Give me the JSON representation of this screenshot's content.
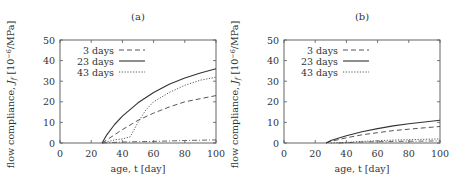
{
  "chart_data": [
    {
      "type": "line",
      "title": "(a)",
      "xlabel": "age, t [day]",
      "ylabel": "flow compliance, J_f [10^-6/MPa]",
      "xlim": [
        0,
        100
      ],
      "ylim": [
        0,
        50
      ],
      "xticks": [
        0,
        20,
        40,
        60,
        80,
        100
      ],
      "yticks": [
        0,
        10,
        20,
        30,
        40,
        50
      ],
      "grid": false,
      "legend_position": "upper left",
      "series": [
        {
          "name": "3 days",
          "style": "dashed",
          "x": [
            27,
            30,
            40,
            50,
            60,
            70,
            80,
            90,
            100
          ],
          "values": [
            0,
            1.5,
            6.5,
            11,
            14.5,
            17.5,
            20,
            21.5,
            23
          ]
        },
        {
          "name": "23 days",
          "style": "solid",
          "x": [
            27,
            30,
            35,
            40,
            50,
            60,
            70,
            80,
            90,
            100
          ],
          "values": [
            0,
            4,
            9,
            13,
            19.5,
            24.5,
            28.5,
            31.5,
            34,
            36
          ]
        },
        {
          "name": "43 days",
          "style": "dotted",
          "x": [
            27,
            35,
            40,
            45,
            50,
            55,
            60,
            70,
            80,
            90,
            100
          ],
          "values": [
            0,
            1.5,
            2,
            3,
            10,
            16,
            20,
            24.5,
            28,
            30.5,
            32
          ]
        },
        {
          "name": "",
          "style": "dash-dot",
          "x": [
            27,
            40,
            60,
            80,
            100
          ],
          "values": [
            0,
            0.5,
            0.8,
            1.2,
            1.5
          ]
        }
      ]
    },
    {
      "type": "line",
      "title": "(b)",
      "xlabel": "age, t [day]",
      "ylabel": "flow compliance, J_f [10^-6/MPa]",
      "xlim": [
        0,
        100
      ],
      "ylim": [
        0,
        50
      ],
      "xticks": [
        0,
        20,
        40,
        60,
        80,
        100
      ],
      "yticks": [
        0,
        10,
        20,
        30,
        40,
        50
      ],
      "grid": false,
      "legend_position": "upper left",
      "series": [
        {
          "name": "3 days",
          "style": "dashed",
          "x": [
            27,
            30,
            40,
            50,
            60,
            70,
            80,
            90,
            100
          ],
          "values": [
            0,
            0.8,
            2.5,
            4,
            5,
            6,
            6.7,
            7.4,
            8
          ]
        },
        {
          "name": "23 days",
          "style": "solid",
          "x": [
            27,
            30,
            40,
            50,
            60,
            70,
            80,
            90,
            100
          ],
          "values": [
            0,
            1.2,
            3.5,
            5.5,
            7,
            8.3,
            9.3,
            10.2,
            11
          ]
        },
        {
          "name": "43 days",
          "style": "dotted",
          "x": [
            30,
            40,
            50,
            60,
            70,
            80,
            90,
            100
          ],
          "values": [
            0,
            0.3,
            0.8,
            1.1,
            1.4,
            1.6,
            1.8,
            2
          ]
        },
        {
          "name": "",
          "style": "dash-dot",
          "x": [
            35,
            50,
            70,
            100
          ],
          "values": [
            0,
            0.5,
            0.8,
            1
          ]
        }
      ]
    }
  ],
  "panels": [
    {
      "title": "(a)",
      "xlabel": "age, t [day]",
      "ylabel_prefix": "flow compliance, ",
      "ylabel_sym": "J",
      "ylabel_sub": "f",
      "ylabel_unit": " [10",
      "ylabel_exp": "−6",
      "ylabel_tail": "/MPa]",
      "legend": [
        "3 days",
        "23 days",
        "43 days"
      ],
      "xticks": [
        "0",
        "20",
        "40",
        "60",
        "80",
        "100"
      ],
      "yticks": [
        "0",
        "10",
        "20",
        "30",
        "40",
        "50"
      ]
    },
    {
      "title": "(b)",
      "xlabel": "age, t [day]",
      "ylabel_prefix": "flow compliance, ",
      "ylabel_sym": "J",
      "ylabel_sub": "f",
      "ylabel_unit": " [10",
      "ylabel_exp": "−6",
      "ylabel_tail": "/MPa]",
      "legend": [
        "3 days",
        "23 days",
        "43 days"
      ],
      "xticks": [
        "0",
        "20",
        "40",
        "60",
        "80",
        "100"
      ],
      "yticks": [
        "0",
        "10",
        "20",
        "30",
        "40",
        "50"
      ]
    }
  ]
}
